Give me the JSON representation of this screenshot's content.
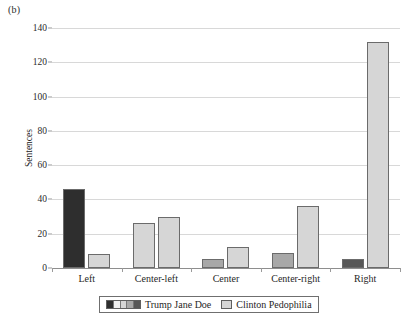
{
  "figure": {
    "panel_label": "(b)"
  },
  "chart_data": {
    "type": "bar",
    "title": "",
    "subtitle": "",
    "xlabel": "",
    "ylabel": "Sentences",
    "ylim": [
      0,
      140
    ],
    "ytick_step": 20,
    "yticks": [
      0,
      20,
      40,
      60,
      80,
      100,
      120,
      140
    ],
    "ytick_labels": [
      "0",
      "20",
      "40",
      "60",
      "80",
      "100",
      "120",
      "140"
    ],
    "grid": true,
    "grid_axis": "y",
    "legend_position": "bottom",
    "categories": [
      "Left",
      "Center-left",
      "Center",
      "Center-right",
      "Right"
    ],
    "series": [
      {
        "name": "Trump Jane Doe",
        "values": [
          46,
          26,
          5,
          9,
          5
        ],
        "bar_colors": [
          "#2e2e2e",
          "#d6d6d6",
          "#a8a8a8",
          "#a8a8a8",
          "#585858"
        ],
        "legend_swatch_type": "multi",
        "legend_swatch_colors": [
          "#2e2e2e",
          "#f0f0f0",
          "#d6d6d6",
          "#a8a8a8",
          "#585858"
        ]
      },
      {
        "name": "Clinton Pedophilia",
        "values": [
          8,
          30,
          12,
          36,
          132
        ],
        "bar_colors": [
          "#d6d6d6",
          "#d6d6d6",
          "#d6d6d6",
          "#d6d6d6",
          "#d6d6d6"
        ],
        "legend_swatch_type": "single",
        "legend_swatch_colors": [
          "#d6d6d6"
        ]
      }
    ],
    "colors": {
      "background": "#ffffff",
      "gridline": "#d8d8d8",
      "axis": "#8e8e8e",
      "bar_outline": "#6b6b6b",
      "text": "#1f1f1f"
    }
  }
}
